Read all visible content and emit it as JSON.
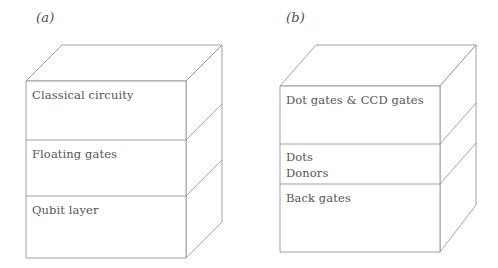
{
  "figure": {
    "background_color": "#ffffff",
    "line_color": "#8c8c8c",
    "text_color": "#555555",
    "panels": [
      {
        "id": "a",
        "label": "(a)",
        "layers": [
          {
            "id": "classical-circuity",
            "lines": [
              "Classical circuity"
            ]
          },
          {
            "id": "floating-gates",
            "lines": [
              "Floating gates"
            ]
          },
          {
            "id": "qubit-layer",
            "lines": [
              "Qubit layer"
            ]
          }
        ]
      },
      {
        "id": "b",
        "label": "(b)",
        "layers": [
          {
            "id": "dot-gates-and-ccd-gates",
            "lines": [
              "Dot gates & CCD gates"
            ]
          },
          {
            "id": "dots-donors",
            "lines": [
              "Dots",
              "Donors"
            ]
          },
          {
            "id": "back-gates",
            "lines": [
              "Back gates"
            ]
          }
        ]
      }
    ]
  },
  "panel_a": {
    "label": "(a)",
    "layer1": "Classical circuity",
    "layer2": "Floating gates",
    "layer3": "Qubit layer"
  },
  "panel_b": {
    "label": "(b)",
    "layer1": "Dot gates & CCD gates",
    "layer2_line1": "Dots",
    "layer2_line2": "Donors",
    "layer3": "Back gates"
  }
}
